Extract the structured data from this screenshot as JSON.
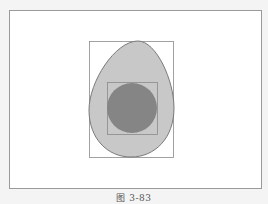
{
  "figure": {
    "caption": "图 3-83",
    "colors": {
      "egg_fill": "#c8c8c8",
      "egg_stroke": "#7a7a7a",
      "circle_fill": "#858585",
      "rect_stroke": "#8a8a8a",
      "background": "#ffffff"
    },
    "shapes": [
      {
        "type": "rect",
        "role": "egg-bounding-box",
        "x": 89,
        "y": 41,
        "width": 84,
        "height": 116
      },
      {
        "type": "path",
        "role": "egg"
      },
      {
        "type": "rect",
        "role": "circle-bounding-box",
        "x": 107,
        "y": 82,
        "width": 50,
        "height": 52
      },
      {
        "type": "circle",
        "role": "inner-circle",
        "cx": 132,
        "cy": 108,
        "r": 25
      }
    ]
  }
}
